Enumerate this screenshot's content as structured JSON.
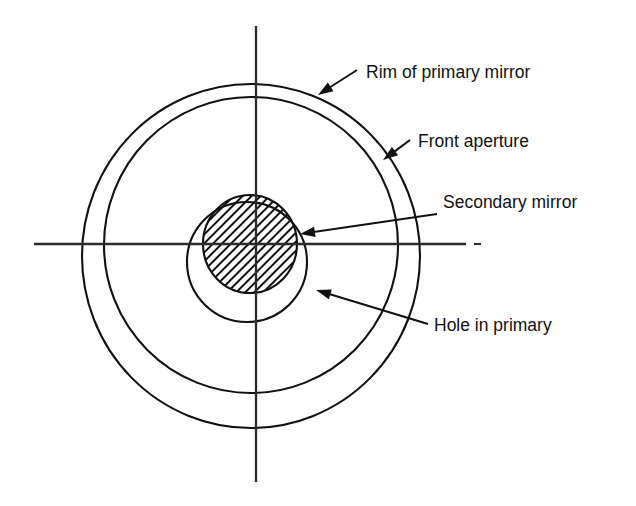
{
  "figure": {
    "kind": "optical-schematic",
    "background_color": "#ffffff",
    "line_color": "#111111",
    "axis_color": "#2b2b2b"
  },
  "labels": [
    {
      "id": "rim-of-primary-mirror",
      "text": "Rim of primary mirror",
      "text_x": 366,
      "text_y": 78,
      "leader_from_x": 357,
      "leader_from_y": 70,
      "leader_to_x": 318,
      "leader_to_y": 95
    },
    {
      "id": "front-aperture",
      "text": "Front aperture",
      "text_x": 418,
      "text_y": 147,
      "leader_from_x": 410,
      "leader_from_y": 140,
      "leader_to_x": 383,
      "leader_to_y": 160
    },
    {
      "id": "secondary-mirror",
      "text": "Secondary mirror",
      "text_x": 443,
      "text_y": 208,
      "leader_from_x": 437,
      "leader_from_y": 214,
      "leader_to_x": 300,
      "leader_to_y": 234
    },
    {
      "id": "hole-in-primary",
      "text": "Hole in primary",
      "text_x": 434,
      "text_y": 331,
      "leader_from_x": 428,
      "leader_from_y": 324,
      "leader_to_x": 316,
      "leader_to_y": 290
    }
  ],
  "geometry": {
    "axes": {
      "center_x": 256,
      "center_y": 244,
      "vertical_top_y": 26,
      "vertical_bottom_y": 482,
      "horizontal_left_x": 34,
      "horizontal_right_x": 466,
      "dash_start_x": 474,
      "dash_end_x": 481
    },
    "rim_of_primary_mirror": {
      "cx": 251,
      "cy": 256,
      "rx": 169,
      "ry": 172
    },
    "front_aperture": {
      "cx": 251,
      "cy": 245,
      "rx": 147,
      "ry": 148
    },
    "hole_in_primary": {
      "cx": 247,
      "cy": 262,
      "rx": 60,
      "ry": 60
    },
    "secondary_mirror": {
      "cx": 250,
      "cy": 244,
      "rx": 47,
      "ry": 49,
      "hatch_spacing": 9,
      "hatch_direction": "lower-left-to-upper-right"
    }
  }
}
